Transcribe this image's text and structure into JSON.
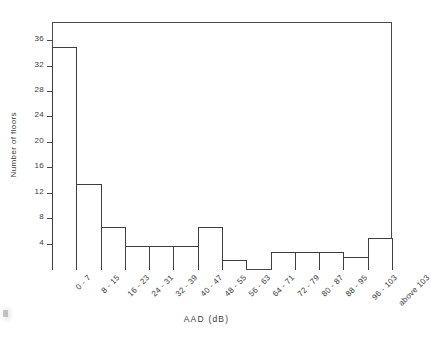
{
  "chart_data": {
    "type": "bar",
    "title": "",
    "xlabel": "AAD  (dB)",
    "ylabel": "Number  of  floors",
    "categories": [
      "0 - 7",
      "8 - 15",
      "16 - 23",
      "24 - 31",
      "32 - 39",
      "40 - 47",
      "48 - 55",
      "56 - 63",
      "64 - 71",
      "72 - 79",
      "80 - 87",
      "88 - 95",
      "96 - 103",
      "above 103"
    ],
    "values": [
      35,
      13.5,
      6.7,
      3.8,
      3.8,
      3.8,
      6.8,
      1.6,
      0,
      2.8,
      2.8,
      2.8,
      2,
      5
    ],
    "ylim": [
      0,
      39
    ],
    "yticks": [
      4,
      8,
      12,
      16,
      20,
      24,
      28,
      32,
      36
    ],
    "ytick_labels": [
      "4",
      "8",
      "12",
      "16",
      "20",
      "24",
      "28",
      "32",
      "36"
    ],
    "grid": false,
    "legend": null,
    "bar_fill": "#ffffff",
    "bar_stroke": "#3f3f3f",
    "axis_color": "#4a4a4a",
    "background": "#ffffff"
  }
}
